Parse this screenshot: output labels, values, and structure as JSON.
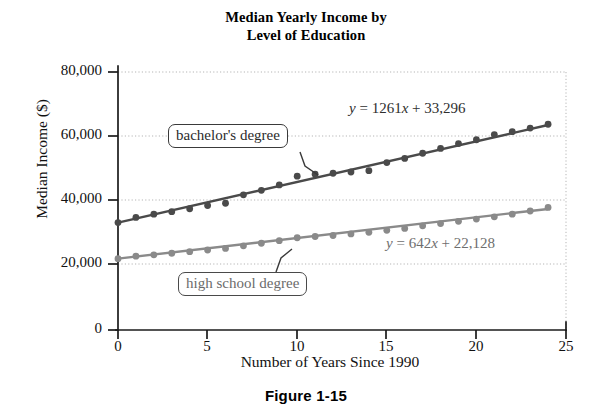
{
  "figure": {
    "caption": "Figure 1-15",
    "title_line1": "Median Yearly Income by",
    "title_line2": "Level of Education"
  },
  "axes": {
    "y_title": "Median Income ($)",
    "x_title": "Number of Years Since 1990",
    "y_ticks": [
      "0",
      "20,000",
      "40,000",
      "60,000",
      "80,000"
    ],
    "x_ticks": [
      "0",
      "5",
      "10",
      "15",
      "20",
      "25"
    ]
  },
  "annotations": {
    "bachelors_callout": "bachelor's degree",
    "highschool_callout": "high school degree",
    "bachelors_equation_y": "y",
    "bachelors_equation_rest": " = 1261",
    "bachelors_equation_x": "x",
    "bachelors_equation_tail": " + 33,296",
    "highschool_equation_y": "y",
    "highschool_equation_rest": " = 642",
    "highschool_equation_x": "x",
    "highschool_equation_tail": " + 22,128"
  },
  "colors": {
    "bachelors": "#4a4a4a",
    "highschool": "#8a8a8a",
    "axis": "#1a1a1a",
    "grid": "#b8b8b8"
  },
  "chart_data": {
    "type": "scatter",
    "title": "Median Yearly Income by Level of Education",
    "xlabel": "Number of Years Since 1990",
    "ylabel": "Median Income ($)",
    "xlim": [
      0,
      25
    ],
    "ylim": [
      0,
      80000
    ],
    "xticks": [
      0,
      5,
      10,
      15,
      20,
      25
    ],
    "yticks": [
      0,
      20000,
      40000,
      60000,
      80000
    ],
    "grid": "dotted-horizontal-and-right-edge",
    "legend": "callout-labels",
    "x": [
      0,
      1,
      2,
      3,
      4,
      5,
      6,
      7,
      8,
      9,
      10,
      11,
      12,
      13,
      14,
      15,
      16,
      17,
      18,
      19,
      20,
      21,
      22,
      23,
      24
    ],
    "series": [
      {
        "name": "bachelor's degree",
        "color": "#4a4a4a",
        "trendline": "y = 1261x + 33,296",
        "slope": 1261,
        "intercept": 33296,
        "values": [
          33296,
          34900,
          35900,
          36700,
          37600,
          38600,
          39300,
          41900,
          43300,
          45000,
          47700,
          48300,
          48600,
          49000,
          49400,
          51900,
          53200,
          54800,
          56300,
          57800,
          59000,
          60600,
          61500,
          62600,
          63800
        ]
      },
      {
        "name": "high school degree",
        "color": "#8a8a8a",
        "trendline": "y = 642x + 22,128",
        "slope": 642,
        "intercept": 22128,
        "values": [
          22128,
          22900,
          23300,
          23800,
          24300,
          24800,
          25300,
          26100,
          26900,
          27700,
          28600,
          29000,
          29300,
          29800,
          30300,
          30900,
          31500,
          32300,
          33000,
          33700,
          34400,
          35100,
          35900,
          36900,
          38000
        ]
      }
    ]
  }
}
